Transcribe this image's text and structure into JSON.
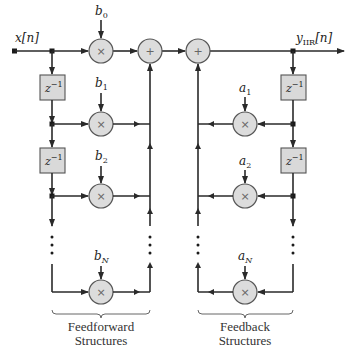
{
  "diagram": {
    "input_label": "x[n]",
    "output_label_main": "y",
    "output_label_sub": "IIR",
    "output_label_suffix": "[n]",
    "delay_label": "z",
    "delay_exponent": "−1",
    "multiply_symbol": "×",
    "add_symbol": "+",
    "feedforward": {
      "coefficients": [
        {
          "name": "b",
          "sub": "0"
        },
        {
          "name": "b",
          "sub": "1"
        },
        {
          "name": "b",
          "sub": "2"
        },
        {
          "name": "b",
          "sub": "N"
        }
      ],
      "caption_line1": "Feedforward",
      "caption_line2": "Structures"
    },
    "feedback": {
      "coefficients": [
        {
          "name": "a",
          "sub": "1"
        },
        {
          "name": "a",
          "sub": "2"
        },
        {
          "name": "a",
          "sub": "N"
        }
      ],
      "caption_line1": "Feedback",
      "caption_line2": "Structures"
    },
    "colors": {
      "wire": "#2a2a2a",
      "node_fill": "#dcdcdc",
      "delay_fill": "#d9d9d9"
    }
  }
}
